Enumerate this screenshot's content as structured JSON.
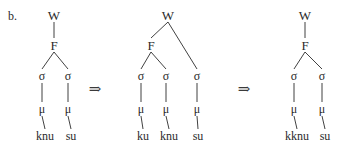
{
  "figure": {
    "panel_label": "b.",
    "background_color": "#ffffff",
    "ink_color": "#2b2b2b",
    "width": 350,
    "height": 151
  },
  "labels": {
    "word": "W",
    "foot": "F",
    "syllable": "σ",
    "mora": "μ",
    "arrow": "⇒"
  },
  "arrows": [
    {
      "symbol": "⇒",
      "x": 95,
      "y": 89
    },
    {
      "symbol": "⇒",
      "x": 244,
      "y": 89
    }
  ],
  "trees": [
    {
      "name": "input-structure",
      "nodes": [
        {
          "id": "W",
          "label": "W",
          "x": 54,
          "y": 15
        },
        {
          "id": "F",
          "label": "F",
          "x": 54,
          "y": 45
        },
        {
          "id": "s1",
          "label": "σ",
          "x": 42,
          "y": 76
        },
        {
          "id": "s2",
          "label": "σ",
          "x": 68,
          "y": 76
        },
        {
          "id": "m1",
          "label": "μ",
          "x": 42,
          "y": 109
        },
        {
          "id": "m2",
          "label": "μ",
          "x": 68,
          "y": 109
        },
        {
          "id": "l1",
          "label": "knu",
          "x": 45,
          "y": 136
        },
        {
          "id": "l2",
          "label": "su",
          "x": 71,
          "y": 136
        }
      ],
      "edges": [
        {
          "from": "W",
          "to": "F"
        },
        {
          "from": "F",
          "to": "s1"
        },
        {
          "from": "F",
          "to": "s2"
        },
        {
          "from": "s1",
          "to": "m1"
        },
        {
          "from": "s2",
          "to": "m2"
        },
        {
          "from": "m1",
          "to": "l1"
        },
        {
          "from": "m2",
          "to": "l2"
        }
      ]
    },
    {
      "name": "intermediate-structure",
      "nodes": [
        {
          "id": "W",
          "label": "W",
          "x": 168,
          "y": 15
        },
        {
          "id": "F",
          "label": "F",
          "x": 151,
          "y": 45
        },
        {
          "id": "s1",
          "label": "σ",
          "x": 141,
          "y": 76
        },
        {
          "id": "s2",
          "label": "σ",
          "x": 166,
          "y": 76
        },
        {
          "id": "s3",
          "label": "σ",
          "x": 197,
          "y": 76
        },
        {
          "id": "m1",
          "label": "μ",
          "x": 141,
          "y": 109
        },
        {
          "id": "m2",
          "label": "μ",
          "x": 166,
          "y": 109
        },
        {
          "id": "m3",
          "label": "μ",
          "x": 197,
          "y": 109
        },
        {
          "id": "l1",
          "label": "ku",
          "x": 143,
          "y": 136
        },
        {
          "id": "l2",
          "label": "knu",
          "x": 169,
          "y": 136
        },
        {
          "id": "l3",
          "label": "su",
          "x": 198,
          "y": 136
        }
      ],
      "edges": [
        {
          "from": "W",
          "to": "F"
        },
        {
          "from": "W",
          "to": "s3"
        },
        {
          "from": "F",
          "to": "s1"
        },
        {
          "from": "F",
          "to": "s2"
        },
        {
          "from": "s1",
          "to": "m1"
        },
        {
          "from": "s2",
          "to": "m2"
        },
        {
          "from": "s3",
          "to": "m3"
        },
        {
          "from": "m1",
          "to": "l1"
        },
        {
          "from": "m2",
          "to": "l2"
        },
        {
          "from": "m3",
          "to": "l3"
        }
      ]
    },
    {
      "name": "output-structure",
      "nodes": [
        {
          "id": "W",
          "label": "W",
          "x": 305,
          "y": 15
        },
        {
          "id": "F",
          "label": "F",
          "x": 305,
          "y": 45
        },
        {
          "id": "s1",
          "label": "σ",
          "x": 294,
          "y": 76
        },
        {
          "id": "s2",
          "label": "σ",
          "x": 322,
          "y": 76
        },
        {
          "id": "m1",
          "label": "μ",
          "x": 294,
          "y": 109
        },
        {
          "id": "m2",
          "label": "μ",
          "x": 322,
          "y": 109
        },
        {
          "id": "l1",
          "label": "kknu",
          "x": 297,
          "y": 136
        },
        {
          "id": "l2",
          "label": "su",
          "x": 325,
          "y": 136
        }
      ],
      "edges": [
        {
          "from": "W",
          "to": "F"
        },
        {
          "from": "F",
          "to": "s1"
        },
        {
          "from": "F",
          "to": "s2"
        },
        {
          "from": "s1",
          "to": "m1"
        },
        {
          "from": "s2",
          "to": "m2"
        },
        {
          "from": "m1",
          "to": "l1"
        },
        {
          "from": "m2",
          "to": "l2"
        }
      ]
    }
  ]
}
